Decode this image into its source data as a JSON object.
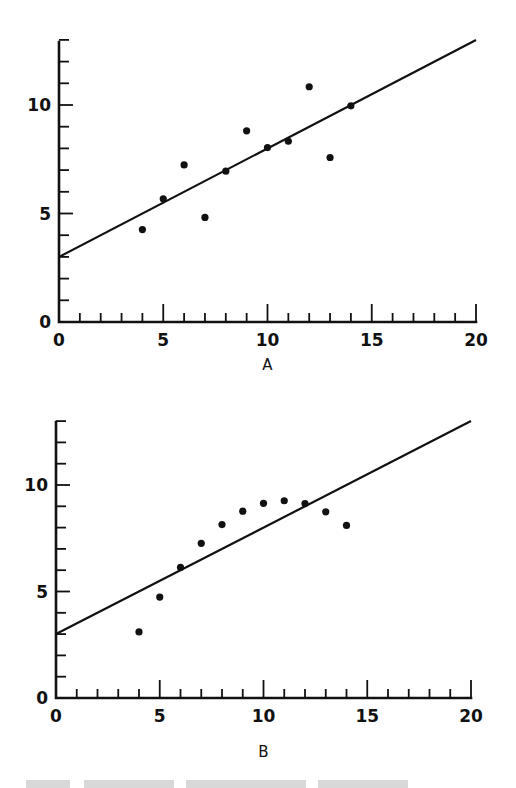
{
  "chart_data": [
    {
      "type": "scatter",
      "title": "",
      "panel_label": "A",
      "xlabel": "A",
      "ylabel": "",
      "xlim": [
        0,
        20
      ],
      "ylim": [
        0,
        13
      ],
      "x_ticks": [
        0,
        5,
        10,
        15,
        20
      ],
      "y_ticks": [
        0,
        5,
        10
      ],
      "x_tick_labels": [
        "0",
        "5",
        "10",
        "15",
        "20"
      ],
      "y_tick_labels": [
        "0",
        "5",
        "10"
      ],
      "minor_tick_step": 1,
      "grid": false,
      "legend": null,
      "series": [
        {
          "name": "observations",
          "kind": "scatter",
          "x": [
            4,
            5,
            6,
            7,
            8,
            9,
            10,
            11,
            12,
            13,
            14
          ],
          "y": [
            4.26,
            5.68,
            7.24,
            4.82,
            6.95,
            8.81,
            8.04,
            8.33,
            10.84,
            7.58,
            9.96
          ]
        },
        {
          "name": "fitted line",
          "kind": "line",
          "x": [
            0,
            20
          ],
          "y": [
            3.0,
            13.0
          ],
          "equation": "y = 3 + 0.5x"
        }
      ]
    },
    {
      "type": "scatter",
      "title": "",
      "panel_label": "B",
      "xlabel": "B",
      "ylabel": "",
      "xlim": [
        0,
        20
      ],
      "ylim": [
        0,
        13
      ],
      "x_ticks": [
        0,
        5,
        10,
        15,
        20
      ],
      "y_ticks": [
        0,
        5,
        10
      ],
      "x_tick_labels": [
        "0",
        "5",
        "10",
        "15",
        "20"
      ],
      "y_tick_labels": [
        "0",
        "5",
        "10"
      ],
      "minor_tick_step": 1,
      "grid": false,
      "legend": null,
      "series": [
        {
          "name": "observations",
          "kind": "scatter",
          "x": [
            4,
            5,
            6,
            7,
            8,
            9,
            10,
            11,
            12,
            13,
            14
          ],
          "y": [
            3.1,
            4.74,
            6.13,
            7.26,
            8.14,
            8.77,
            9.14,
            9.26,
            9.13,
            8.74,
            8.1
          ]
        },
        {
          "name": "fitted line",
          "kind": "line",
          "x": [
            0,
            20
          ],
          "y": [
            3.0,
            13.0
          ],
          "equation": "y = 3 + 0.5x"
        }
      ]
    }
  ],
  "panels": {
    "a": {
      "label": "A"
    },
    "b": {
      "label": "B"
    }
  }
}
